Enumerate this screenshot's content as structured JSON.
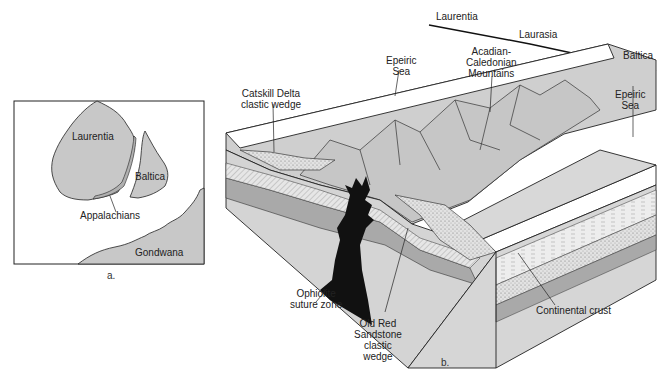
{
  "panel_a": {
    "caption": "a.",
    "labels": {
      "laurentia": "Laurentia",
      "baltica": "Baltica",
      "appalachians": "Appalachians",
      "gondwana": "Gondwana"
    }
  },
  "panel_b": {
    "caption": "b.",
    "top_labels": {
      "laurentia": "Laurentia",
      "laurasia": "Laurasia",
      "baltica": "Baltica"
    },
    "labels": {
      "epeiric_sea_left_1": "Epeiric",
      "epeiric_sea_left_2": "Sea",
      "acadian_1": "Acadian-",
      "acadian_2": "Caledonian",
      "acadian_3": "Mountains",
      "epeiric_sea_right_1": "Epeiric",
      "epeiric_sea_right_2": "Sea",
      "catskill_1": "Catskill Delta",
      "catskill_2": "clastic wedge",
      "ophiolite_1": "Ophiolite",
      "ophiolite_2": "suture zone",
      "old_red_1": "Old Red",
      "old_red_2": "Sandstone",
      "old_red_3": "clastic",
      "old_red_4": "wedge",
      "continental_crust": "Continental crust"
    }
  },
  "colors": {
    "landmass": "#c8c8c8",
    "crust": "#d4d4d4",
    "dark_band": "#a9a9a9",
    "suture": "#111111",
    "outline": "#1a1a1a",
    "sea": "#ffffff"
  }
}
